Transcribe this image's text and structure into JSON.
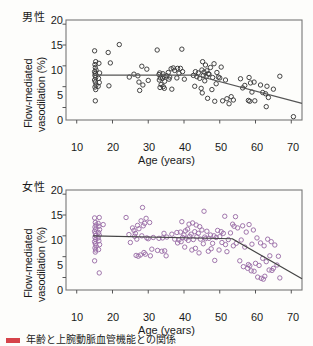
{
  "figure": {
    "caption_marker": "red-square-marker",
    "caption_text": "年齢と上腕動脈血管機能との関係"
  },
  "chart_data": [
    {
      "type": "scatter",
      "id": "male",
      "title": "男性",
      "xlabel": "Age (years)",
      "ylabel": "Flow-mediated vasodilation (%)",
      "ylabel_line1": "Flow-mediated",
      "ylabel_line2": "vasodilation (%)",
      "xlim": [
        7,
        73
      ],
      "ylim": [
        -3,
        21
      ],
      "xticks": [
        10,
        20,
        30,
        40,
        50,
        60,
        70
      ],
      "yticks": [
        0,
        5,
        10,
        15,
        20
      ],
      "grid": false,
      "legend": "none",
      "marker": "open-circle",
      "marker_color": "#3a3a3a",
      "fit_color": "#555555",
      "fit_type": "segmented-linear",
      "fit_breakpoint_x": 43,
      "fit_points": [
        [
          14.5,
          7.8
        ],
        [
          43,
          7.8
        ],
        [
          73,
          1.0
        ]
      ],
      "points": [
        [
          15,
          13.6
        ],
        [
          15.3,
          11.0
        ],
        [
          15.1,
          10.3
        ],
        [
          15.2,
          9.6
        ],
        [
          15.4,
          9.0
        ],
        [
          15.0,
          8.6
        ],
        [
          15.2,
          8.2
        ],
        [
          15.1,
          7.7
        ],
        [
          15.3,
          7.2
        ],
        [
          15.0,
          6.6
        ],
        [
          15.2,
          6.1
        ],
        [
          15.4,
          5.4
        ],
        [
          15.1,
          4.9
        ],
        [
          15.3,
          4.3
        ],
        [
          15.2,
          1.6
        ],
        [
          16.2,
          10.6
        ],
        [
          16.4,
          8.3
        ],
        [
          16.1,
          7.0
        ],
        [
          16.3,
          6.0
        ],
        [
          16.0,
          5.1
        ],
        [
          18.8,
          13.2
        ],
        [
          19.4,
          10.7
        ],
        [
          19.0,
          5.2
        ],
        [
          21.9,
          15.1
        ],
        [
          24.7,
          7.3
        ],
        [
          26.0,
          8.0
        ],
        [
          27.1,
          7.6
        ],
        [
          27.4,
          6.1
        ],
        [
          27.6,
          4.1
        ],
        [
          28.2,
          9.9
        ],
        [
          28.5,
          5.4
        ],
        [
          29.6,
          9.2
        ],
        [
          30.0,
          6.5
        ],
        [
          32.5,
          13.8
        ],
        [
          33.2,
          8.3
        ],
        [
          33.0,
          7.9
        ],
        [
          33.4,
          7.1
        ],
        [
          33.1,
          6.6
        ],
        [
          33.6,
          5.5
        ],
        [
          33.3,
          4.8
        ],
        [
          34.1,
          8.1
        ],
        [
          34.4,
          7.5
        ],
        [
          34.0,
          7.0
        ],
        [
          34.6,
          6.3
        ],
        [
          34.2,
          5.0
        ],
        [
          34.5,
          4.6
        ],
        [
          35.6,
          8.4
        ],
        [
          35.2,
          7.6
        ],
        [
          35.8,
          6.8
        ],
        [
          36.4,
          9.3
        ],
        [
          36.0,
          7.3
        ],
        [
          36.6,
          4.4
        ],
        [
          37.0,
          9.5
        ],
        [
          37.4,
          8.9
        ],
        [
          38.2,
          9.4
        ],
        [
          38.6,
          8.2
        ],
        [
          38.0,
          7.1
        ],
        [
          39.4,
          14.0
        ],
        [
          39.0,
          9.4
        ],
        [
          39.6,
          8.6
        ],
        [
          40.1,
          6.8
        ],
        [
          42.6,
          7.7
        ],
        [
          43.2,
          8.6
        ],
        [
          43.6,
          7.4
        ],
        [
          43.0,
          5.1
        ],
        [
          44.0,
          8.3
        ],
        [
          44.4,
          7.0
        ],
        [
          44.8,
          4.6
        ],
        [
          45.2,
          11.0
        ],
        [
          45.0,
          9.0
        ],
        [
          45.6,
          8.5
        ],
        [
          45.4,
          7.7
        ],
        [
          45.8,
          6.4
        ],
        [
          45.1,
          3.5
        ],
        [
          46.0,
          10.2
        ],
        [
          46.4,
          8.8
        ],
        [
          46.8,
          8.1
        ],
        [
          46.2,
          7.4
        ],
        [
          46.6,
          2.2
        ],
        [
          47.4,
          9.6
        ],
        [
          47.0,
          8.0
        ],
        [
          47.8,
          4.3
        ],
        [
          48.4,
          10.5
        ],
        [
          48.0,
          7.2
        ],
        [
          48.6,
          1.5
        ],
        [
          49.2,
          8.4
        ],
        [
          49.6,
          7.3
        ],
        [
          49.0,
          5.7
        ],
        [
          50.4,
          9.7
        ],
        [
          50.0,
          7.1
        ],
        [
          50.8,
          1.6
        ],
        [
          51.6,
          6.6
        ],
        [
          52.0,
          2.1
        ],
        [
          52.6,
          0.9
        ],
        [
          53.2,
          2.6
        ],
        [
          53.8,
          1.8
        ],
        [
          55.8,
          6.9
        ],
        [
          56.4,
          4.7
        ],
        [
          57.0,
          5.3
        ],
        [
          58.2,
          7.2
        ],
        [
          58.6,
          5.9
        ],
        [
          58.0,
          1.7
        ],
        [
          58.4,
          1.5
        ],
        [
          59.6,
          6.1
        ],
        [
          59.0,
          3.7
        ],
        [
          59.8,
          1.6
        ],
        [
          61.4,
          5.4
        ],
        [
          62.0,
          3.6
        ],
        [
          62.8,
          3.3
        ],
        [
          63.2,
          5.1
        ],
        [
          63.6,
          2.4
        ],
        [
          63.0,
          0.2
        ],
        [
          65.0,
          4.4
        ],
        [
          66.8,
          7.5
        ],
        [
          70.6,
          -2.2
        ]
      ]
    },
    {
      "type": "scatter",
      "id": "female",
      "title": "女性",
      "xlabel": "Age (years)",
      "ylabel": "Flow-mediated vasodilation (%)",
      "ylabel_line1": "Flow-mediated",
      "ylabel_line2": "vasodilation (%)",
      "xlim": [
        7,
        73
      ],
      "ylim": [
        -3,
        21
      ],
      "xticks": [
        10,
        20,
        30,
        40,
        50,
        60,
        70
      ],
      "yticks": [
        0,
        5,
        10,
        15,
        20
      ],
      "grid": false,
      "legend": "none",
      "marker": "open-circle",
      "marker_color": "#9b6fa8",
      "fit_color": "#444444",
      "fit_type": "segmented-linear",
      "fit_breakpoint_x": 53.5,
      "fit_points": [
        [
          14.5,
          10.0
        ],
        [
          53.5,
          9.3
        ],
        [
          73,
          -0.3
        ]
      ],
      "points": [
        [
          15.0,
          14.3
        ],
        [
          15.2,
          13.2
        ],
        [
          15.4,
          12.6
        ],
        [
          15.1,
          12.1
        ],
        [
          15.3,
          11.6
        ],
        [
          15.0,
          11.1
        ],
        [
          15.2,
          10.6
        ],
        [
          15.4,
          10.1
        ],
        [
          15.1,
          9.6
        ],
        [
          15.3,
          9.1
        ],
        [
          15.0,
          8.6
        ],
        [
          15.2,
          8.1
        ],
        [
          15.4,
          7.6
        ],
        [
          15.1,
          7.1
        ],
        [
          15.3,
          6.6
        ],
        [
          15.2,
          6.1
        ],
        [
          15.0,
          4.0
        ],
        [
          16.3,
          14.4
        ],
        [
          16.0,
          13.0
        ],
        [
          16.2,
          12.3
        ],
        [
          16.4,
          11.5
        ],
        [
          16.1,
          10.8
        ],
        [
          16.3,
          10.2
        ],
        [
          16.0,
          9.5
        ],
        [
          16.2,
          8.8
        ],
        [
          16.4,
          7.9
        ],
        [
          16.1,
          6.7
        ],
        [
          16.3,
          1.1
        ],
        [
          17.4,
          12.7
        ],
        [
          23.8,
          14.4
        ],
        [
          24.6,
          10.3
        ],
        [
          25.0,
          8.4
        ],
        [
          25.6,
          11.9
        ],
        [
          26.0,
          11.3
        ],
        [
          26.4,
          10.6
        ],
        [
          26.2,
          9.9
        ],
        [
          26.8,
          9.2
        ],
        [
          26.6,
          5.3
        ],
        [
          27.0,
          12.5
        ],
        [
          27.4,
          11.7
        ],
        [
          27.8,
          5.4
        ],
        [
          27.2,
          5.1
        ],
        [
          28.4,
          16.8
        ],
        [
          28.0,
          13.6
        ],
        [
          28.6,
          12.4
        ],
        [
          28.2,
          10.0
        ],
        [
          28.8,
          6.0
        ],
        [
          29.4,
          14.2
        ],
        [
          29.0,
          13.0
        ],
        [
          29.6,
          9.5
        ],
        [
          29.2,
          5.6
        ],
        [
          30.4,
          13.2
        ],
        [
          30.0,
          9.3
        ],
        [
          30.6,
          5.2
        ],
        [
          31.4,
          9.6
        ],
        [
          31.0,
          6.8
        ],
        [
          32.6,
          6.5
        ],
        [
          33.0,
          9.4
        ],
        [
          33.8,
          6.3
        ],
        [
          34.4,
          10.6
        ],
        [
          34.0,
          9.5
        ],
        [
          34.6,
          6.4
        ],
        [
          35.2,
          9.7
        ],
        [
          35.0,
          5.2
        ],
        [
          36.6,
          10.4
        ],
        [
          37.4,
          9.2
        ],
        [
          38.0,
          10.8
        ],
        [
          38.6,
          9.0
        ],
        [
          38.2,
          8.3
        ],
        [
          39.4,
          13.4
        ],
        [
          39.0,
          10.9
        ],
        [
          39.6,
          9.6
        ],
        [
          39.2,
          8.6
        ],
        [
          40.4,
          11.2
        ],
        [
          40.0,
          10.2
        ],
        [
          40.6,
          9.4
        ],
        [
          40.2,
          7.3
        ],
        [
          41.4,
          12.8
        ],
        [
          41.0,
          11.6
        ],
        [
          41.6,
          9.9
        ],
        [
          41.2,
          8.9
        ],
        [
          42.4,
          13.1
        ],
        [
          42.0,
          10.4
        ],
        [
          42.6,
          9.1
        ],
        [
          42.2,
          6.6
        ],
        [
          43.4,
          12.6
        ],
        [
          43.0,
          11.0
        ],
        [
          43.6,
          9.8
        ],
        [
          43.2,
          7.0
        ],
        [
          44.4,
          12.2
        ],
        [
          44.0,
          10.6
        ],
        [
          44.6,
          9.2
        ],
        [
          44.2,
          5.9
        ],
        [
          45.6,
          15.9
        ],
        [
          45.0,
          11.4
        ],
        [
          45.8,
          9.7
        ],
        [
          45.4,
          8.1
        ],
        [
          46.4,
          11.1
        ],
        [
          46.0,
          9.3
        ],
        [
          46.8,
          6.3
        ],
        [
          47.4,
          10.2
        ],
        [
          47.0,
          9.4
        ],
        [
          47.6,
          6.9
        ],
        [
          48.4,
          10.0
        ],
        [
          48.0,
          8.2
        ],
        [
          48.6,
          4.1
        ],
        [
          49.4,
          11.3
        ],
        [
          49.0,
          9.6
        ],
        [
          49.8,
          6.6
        ],
        [
          50.4,
          11.0
        ],
        [
          50.0,
          9.8
        ],
        [
          50.6,
          8.4
        ],
        [
          51.4,
          14.7
        ],
        [
          51.0,
          10.6
        ],
        [
          51.6,
          7.9
        ],
        [
          52.4,
          9.1
        ],
        [
          52.0,
          6.2
        ],
        [
          53.6,
          12.8
        ],
        [
          53.0,
          10.7
        ],
        [
          53.8,
          7.6
        ],
        [
          54.4,
          14.6
        ],
        [
          54.0,
          12.3
        ],
        [
          54.6,
          8.2
        ],
        [
          55.0,
          11.9
        ],
        [
          55.6,
          4.0
        ],
        [
          56.4,
          12.4
        ],
        [
          56.0,
          9.0
        ],
        [
          56.6,
          2.6
        ],
        [
          57.4,
          10.9
        ],
        [
          57.0,
          7.3
        ],
        [
          57.8,
          2.2
        ],
        [
          58.2,
          12.7
        ],
        [
          58.0,
          3.1
        ],
        [
          58.4,
          2.8
        ],
        [
          58.8,
          1.6
        ],
        [
          59.4,
          11.4
        ],
        [
          59.0,
          8.0
        ],
        [
          59.6,
          1.5
        ],
        [
          60.4,
          9.5
        ],
        [
          60.0,
          3.4
        ],
        [
          60.6,
          0.1
        ],
        [
          61.4,
          8.3
        ],
        [
          61.0,
          2.9
        ],
        [
          61.6,
          -0.2
        ],
        [
          62.4,
          7.6
        ],
        [
          62.0,
          4.6
        ],
        [
          62.6,
          0.3
        ],
        [
          62.2,
          -0.4
        ],
        [
          63.4,
          9.2
        ],
        [
          63.0,
          3.8
        ],
        [
          63.8,
          1.8
        ],
        [
          64.4,
          8.6
        ],
        [
          64.0,
          5.2
        ],
        [
          64.6,
          1.7
        ],
        [
          65.4,
          7.8
        ],
        [
          65.0,
          2.2
        ],
        [
          66.4,
          5.1
        ],
        [
          66.0,
          3.0
        ],
        [
          66.8,
          -0.1
        ]
      ]
    }
  ]
}
